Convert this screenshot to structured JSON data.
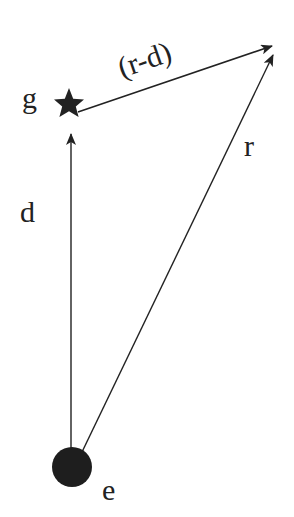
{
  "diagram": {
    "labels": {
      "g": "g",
      "e": "e",
      "d": "d",
      "r": "r",
      "r_minus_d": "(r-d)"
    },
    "nodes": [
      {
        "id": "g",
        "shape": "star",
        "label": "g"
      },
      {
        "id": "e",
        "shape": "circle",
        "label": "e"
      }
    ],
    "edges": [
      {
        "from": "e",
        "to": "g",
        "label": "d"
      },
      {
        "from": "e",
        "to": "end",
        "label": "r"
      },
      {
        "from": "g",
        "to": "end",
        "label": "(r-d)"
      }
    ],
    "colors": {
      "ink": "#222222",
      "background": "#ffffff"
    }
  }
}
